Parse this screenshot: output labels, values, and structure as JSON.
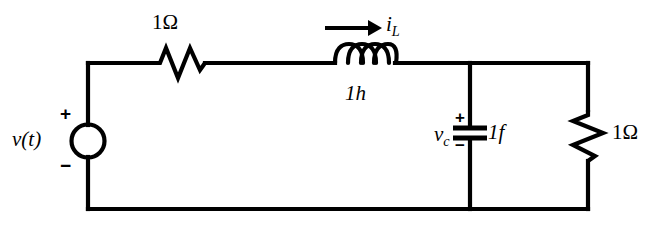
{
  "figure": {
    "name": "rlc-circuit-schematic",
    "background_color": "#ffffff",
    "line_color": "#000000"
  },
  "labels": {
    "series_resistor": "1Ω",
    "parallel_resistor": "1Ω",
    "inductor_value": "1h",
    "capacitor_value": "1f",
    "inductor_current": "i",
    "inductor_current_sub": "L",
    "capacitor_voltage": "v",
    "capacitor_voltage_sub": "c",
    "source_label": "v(t)",
    "source_plus": "+",
    "source_minus": "−",
    "capacitor_plus": "+",
    "capacitor_minus": "−"
  },
  "components": [
    {
      "name": "voltage-source",
      "type": "independent-voltage-source",
      "value": "v(t)",
      "orientation": "vertical"
    },
    {
      "name": "series-resistor",
      "type": "resistor",
      "value": "1Ω",
      "orientation": "horizontal"
    },
    {
      "name": "inductor",
      "type": "inductor",
      "value": "1h",
      "orientation": "horizontal",
      "coil_loops": 4
    },
    {
      "name": "capacitor",
      "type": "capacitor",
      "value": "1f",
      "orientation": "vertical"
    },
    {
      "name": "load-resistor",
      "type": "resistor",
      "value": "1Ω",
      "orientation": "vertical"
    }
  ],
  "annotations": [
    {
      "name": "inductor-current-arrow",
      "direction": "right",
      "label": "i_L"
    }
  ]
}
